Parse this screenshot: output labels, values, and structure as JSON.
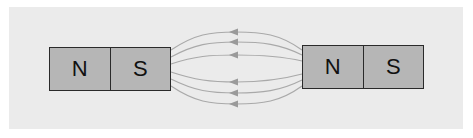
{
  "diagram": {
    "title": "",
    "background_color": "#ebebeb",
    "line_color": "#a9a9a9",
    "magnet_fill": "#b6b6b6",
    "magnet_border": "#2a2a2a",
    "magnets": [
      {
        "id": "left",
        "poles": [
          {
            "label": "N"
          },
          {
            "label": "S"
          }
        ]
      },
      {
        "id": "right",
        "poles": [
          {
            "label": "N"
          },
          {
            "label": "S"
          }
        ]
      }
    ],
    "field_lines": {
      "count": 6,
      "direction": "right-to-left",
      "from": "right magnet N pole",
      "to": "left magnet S pole",
      "arrow_glyph": "triangle-left"
    }
  }
}
